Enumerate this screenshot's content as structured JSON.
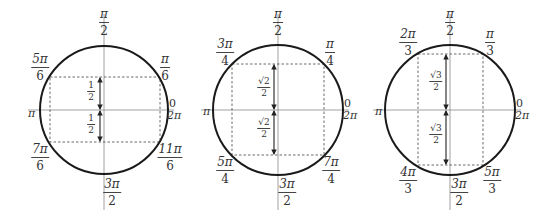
{
  "diagram": {
    "colors": {
      "circle": "#1a1a1a",
      "axis": "#888888",
      "dashed": "#444444",
      "arrow": "#222222",
      "text": "#333333"
    },
    "circles": [
      {
        "id": "sixths",
        "center": [
          104,
          110
        ],
        "radius": 64,
        "rect": {
          "x1": 50,
          "x2": 160,
          "y1": 77,
          "y2": 142
        },
        "arrow_x": 100,
        "labels": {
          "top": {
            "num": "π",
            "den": "2"
          },
          "bottom": {
            "num": "3π",
            "den": "2"
          },
          "left": "π",
          "right_top": "0",
          "right_bottom": "2π",
          "q1": {
            "num": "π",
            "den": "6"
          },
          "q2": {
            "num": "5π",
            "den": "6"
          },
          "q3": {
            "num": "7π",
            "den": "6"
          },
          "q4": {
            "num": "11π",
            "den": "6"
          },
          "upper_value": {
            "num": "1",
            "den": "2"
          },
          "lower_value": {
            "num": "1",
            "den": "2"
          }
        }
      },
      {
        "id": "fourths",
        "center": [
          278,
          110
        ],
        "radius": 65,
        "rect": {
          "x1": 232,
          "x2": 324,
          "y1": 64,
          "y2": 155
        },
        "arrow_x": 274,
        "labels": {
          "top": {
            "num": "π",
            "den": "2"
          },
          "bottom": {
            "num": "3π",
            "den": "2"
          },
          "left": "π",
          "right_top": "0",
          "right_bottom": "2π",
          "q1": {
            "num": "π",
            "den": "4"
          },
          "q2": {
            "num": "3π",
            "den": "4"
          },
          "q3": {
            "num": "5π",
            "den": "4"
          },
          "q4": {
            "num": "7π",
            "den": "4"
          },
          "upper_value": {
            "num": "√2",
            "den": "2"
          },
          "lower_value": {
            "num": "√2",
            "den": "2"
          }
        }
      },
      {
        "id": "thirds",
        "center": [
          450,
          110
        ],
        "radius": 65,
        "rect": {
          "x1": 418,
          "x2": 483,
          "y1": 54,
          "y2": 165
        },
        "arrow_x": 446,
        "labels": {
          "top": {
            "num": "π",
            "den": "2"
          },
          "bottom": {
            "num": "3π",
            "den": "2"
          },
          "left": "π",
          "right_top": "0",
          "right_bottom": "2π",
          "q1": {
            "num": "π",
            "den": "3"
          },
          "q2": {
            "num": "2π",
            "den": "3"
          },
          "q3": {
            "num": "4π",
            "den": "3"
          },
          "q4": {
            "num": "5π",
            "den": "3"
          },
          "upper_value": {
            "num": "√3",
            "den": "2"
          },
          "lower_value": {
            "num": "√3",
            "den": "2"
          }
        }
      }
    ]
  }
}
